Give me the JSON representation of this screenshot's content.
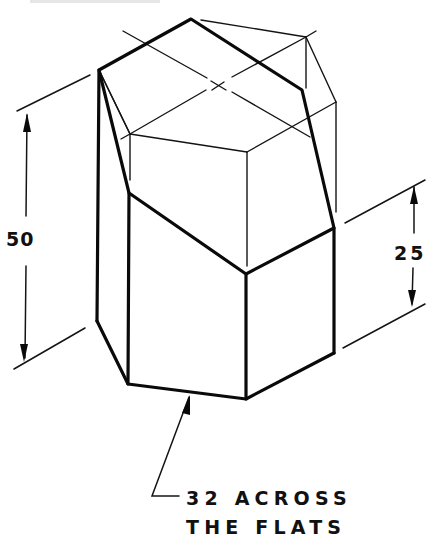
{
  "drawing": {
    "type": "isometric technical drawing",
    "subject": "hexagonal prism with oblique cut top",
    "dimensions": {
      "overall_height": "50",
      "short_side_height": "25",
      "across_flats_note_line1": "32 ACROSS",
      "across_flats_note_line2": "THE FLATS"
    },
    "colors": {
      "line": "#0a0a0a",
      "background": "#ffffff"
    }
  }
}
